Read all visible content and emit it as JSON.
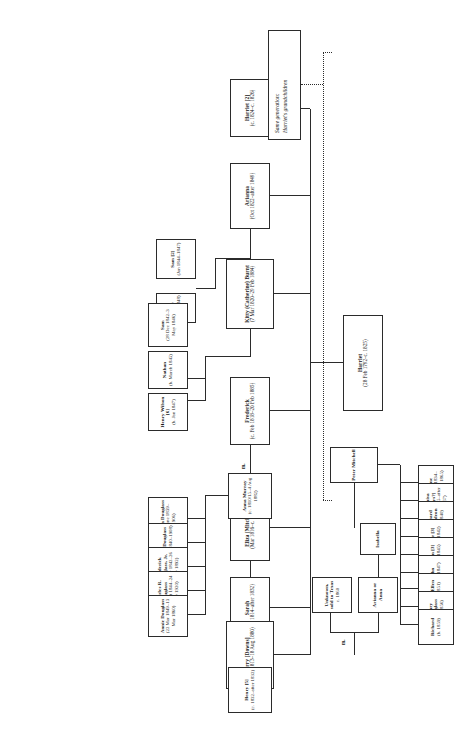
{
  "chart_title": "Harriet family genealogy chart",
  "legend": {
    "line1": "Same generation:",
    "line2": "Harriet's grandchildren"
  },
  "marriage_label": "m.",
  "nodes": {
    "harriet_root": {
      "name": "Harriet",
      "dates": "(28 Feb 1792–c. 1825)"
    },
    "harriet2": {
      "name": "Harriet [2]",
      "dates": "(c. 1824–c. 1826)"
    },
    "arianna": {
      "name": "Arianna",
      "dates": "(Oct 1822–after 1849)"
    },
    "kitty": {
      "name": "Kitty (Catherine) Burnt",
      "dates": "(7 Mar 1820–29 Feb 1884)"
    },
    "frederick": {
      "name": "Frederick",
      "dates": "(c. Feb 1818–20 Feb 1885)"
    },
    "eliza": {
      "name": "Eliza [Mitchell]",
      "dates": "(Mar 1816–c. 1875)"
    },
    "sarah": {
      "name": "Sarah",
      "dates": "(Aug 1814–after 1832)"
    },
    "perry": {
      "name": "Perry [Downs]",
      "dates": "(7 Jan 1813–18 Aug 1880)"
    },
    "sam2": {
      "name": "Sam [2]",
      "dates": "(Jan 1844–1847)"
    },
    "mary": {
      "name": "Mary",
      "dates": "(1847–1848)"
    },
    "sam": {
      "name": "Sam",
      "dates": "(28 Dec 1842–3 May 1846)"
    },
    "nathan": {
      "name": "Nathan",
      "dates": "(b. March 1845)"
    },
    "henry_wilson": {
      "name": "Henry Wilson [6]",
      "dates": "(b. Jan 1847)"
    },
    "anna_murray": {
      "name": "Anna Murray",
      "dates": "(c. 1810/15–4 Aug 1882)"
    },
    "rosetta": {
      "name": "Rosetta Douglass",
      "dates": "(24 June 1839–1906)"
    },
    "lewis": {
      "name": "Lewis Douglass",
      "dates": "(9 Oct 1840–1908)"
    },
    "frederick_jr": {
      "name": "Frederick Douglass, Jr.",
      "dates": "(3 Mar 1842–26 July 1892)"
    },
    "charles": {
      "name": "Charles R. Douglass",
      "dates": "(21 Oct 1844–24 Nov 1920)"
    },
    "annie": {
      "name": "Annie Douglass",
      "dates": "(22 Mar 1849–13 Mar 1860)"
    },
    "peter_mitchell": {
      "name": "Peter Mitchell",
      "dates": ""
    },
    "jane": {
      "name": "Jane",
      "dates": "(b. c. 1834–before 1865)"
    },
    "louisa": {
      "name": "Louisa [Keys?]",
      "dates": "(b. 1835–after 1867)"
    },
    "edward": {
      "name": "Edward Napoleon",
      "dates": "(b. 1840)"
    },
    "peter3": {
      "name": "Peter [3]",
      "dates": "(b.c. 1842)"
    },
    "susan3": {
      "name": "Susan [3]",
      "dates": "(b.c. 1845)"
    },
    "john": {
      "name": "John",
      "dates": "(b.c. 1847)"
    },
    "ella_ellen": {
      "name": "Ella/Ellen",
      "dates": "(b. 1851)"
    },
    "mary_douglass": {
      "name": "Mary Douglass",
      "dates": "(b. 1856)"
    },
    "richard": {
      "name": "Richard",
      "dates": "(b. 1859)"
    },
    "henry5": {
      "name": "Henry [5]",
      "dates": "(c. 1832–after 1832)"
    },
    "unknown_texas": {
      "name": "Unknown, sold to Texas",
      "dates": "c. 1860"
    },
    "arianna_anna": {
      "name": "Arianna or Anna",
      "dates": ""
    },
    "isabella": {
      "name": "Isabella",
      "dates": ""
    }
  }
}
